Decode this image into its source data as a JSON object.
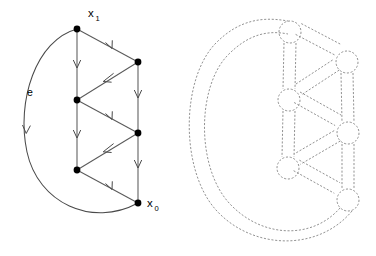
{
  "figure": {
    "background_color": "#ffffff",
    "panels": [
      {
        "id": "left-panel",
        "name": "directed-graph-panel",
        "style": "solid",
        "description": "Directed graph drawn with solid arrows, black vertex dots, base point x0 and vertex x1, and a large loop edge labelled e"
      },
      {
        "id": "right-panel",
        "name": "ribbon-graph-panel",
        "style": "dashed",
        "description": "Same graph thickened into a ribbon/handlebody, drawn entirely with grey dashed outlines; each vertex becomes a small circle and each edge a pair of parallel dashed strands"
      }
    ]
  },
  "colors": {
    "background": "#ffffff",
    "solid_stroke": "#5a5a5a",
    "loop_stroke": "#4a4a4a",
    "vertex_fill": "#000000",
    "label_text": "#000000",
    "dashed_stroke": "#8c8c8c"
  },
  "labels": {
    "x1": {
      "base": "x",
      "sub": "1",
      "x": 88,
      "y": 17
    },
    "x0": {
      "base": "x",
      "sub": "0",
      "x": 147,
      "y": 207
    },
    "e": {
      "text": "e",
      "x": 27,
      "y": 96
    }
  },
  "left_graph": {
    "vertices": [
      {
        "id": "x1",
        "name": "vertex-x1",
        "x": 77,
        "y": 29,
        "r": 3.4,
        "label": "x1"
      },
      {
        "id": "b1",
        "name": "vertex-b1",
        "x": 138,
        "y": 62,
        "r": 3.4,
        "label": ""
      },
      {
        "id": "a1",
        "name": "vertex-a1",
        "x": 77,
        "y": 100,
        "r": 3.4,
        "label": ""
      },
      {
        "id": "b2",
        "name": "vertex-b2",
        "x": 138,
        "y": 133,
        "r": 3.4,
        "label": ""
      },
      {
        "id": "a2",
        "name": "vertex-a2",
        "x": 77,
        "y": 170,
        "r": 3.4,
        "label": ""
      },
      {
        "id": "x0",
        "name": "vertex-x0",
        "x": 138,
        "y": 203,
        "r": 3.4,
        "label": "x0"
      }
    ],
    "edges": [
      {
        "id": "e1",
        "name": "edge-x1-a1",
        "from": "x1",
        "to": "a1",
        "kind": "straight",
        "arrow_t": 0.52
      },
      {
        "id": "e2",
        "name": "edge-x1-b1",
        "from": "x1",
        "to": "b1",
        "kind": "straight",
        "arrow_t": 0.55
      },
      {
        "id": "e3",
        "name": "edge-b1-a1",
        "from": "b1",
        "to": "a1",
        "kind": "straight",
        "arrow_t": 0.5
      },
      {
        "id": "e4",
        "name": "edge-b1-b2",
        "from": "b1",
        "to": "b2",
        "kind": "straight",
        "arrow_t": 0.48
      },
      {
        "id": "e5",
        "name": "edge-a1-b2",
        "from": "a1",
        "to": "b2",
        "kind": "straight",
        "arrow_t": 0.55
      },
      {
        "id": "e6",
        "name": "edge-a1-a2",
        "from": "a1",
        "to": "a2",
        "kind": "straight",
        "arrow_t": 0.52
      },
      {
        "id": "e7",
        "name": "edge-b2-a2",
        "from": "b2",
        "to": "a2",
        "kind": "straight",
        "arrow_t": 0.5
      },
      {
        "id": "e8",
        "name": "edge-b2-x0",
        "from": "b2",
        "to": "x0",
        "kind": "straight",
        "arrow_t": 0.48
      },
      {
        "id": "e9",
        "name": "edge-a2-x0",
        "from": "a2",
        "to": "x0",
        "kind": "straight",
        "arrow_t": 0.55
      },
      {
        "id": "e10",
        "name": "edge-e-loop",
        "from": "x0",
        "to": "x1",
        "kind": "loop",
        "label": "e",
        "arrow_t": 0.55
      }
    ],
    "loop_path": "M138,203 C92,228 38,203 27,152 C16,101 36,40 77,29",
    "arrow_count": 10
  },
  "right_graph": {
    "vertices": [
      {
        "id": "r-x1",
        "name": "ribbon-vertex-x1",
        "x": 290,
        "y": 32,
        "r": 11
      },
      {
        "id": "r-b1",
        "name": "ribbon-vertex-b1",
        "x": 347,
        "y": 62,
        "r": 11
      },
      {
        "id": "r-a1",
        "name": "ribbon-vertex-a1",
        "x": 289,
        "y": 100,
        "r": 11
      },
      {
        "id": "r-b2",
        "name": "ribbon-vertex-b2",
        "x": 348,
        "y": 133,
        "r": 11
      },
      {
        "id": "r-a2",
        "name": "ribbon-vertex-a2",
        "x": 288,
        "y": 168,
        "r": 11
      },
      {
        "id": "r-x0",
        "name": "ribbon-vertex-x0",
        "x": 348,
        "y": 200,
        "r": 11
      }
    ],
    "edges": [
      {
        "id": "r-e1",
        "name": "ribbon-edge-x1-a1",
        "from": "r-x1",
        "to": "r-a1",
        "half_width": 6
      },
      {
        "id": "r-e2",
        "name": "ribbon-edge-x1-b1",
        "from": "r-x1",
        "to": "r-b1",
        "half_width": 6
      },
      {
        "id": "r-e3",
        "name": "ribbon-edge-b1-a1",
        "from": "r-b1",
        "to": "r-a1",
        "half_width": 6
      },
      {
        "id": "r-e4",
        "name": "ribbon-edge-b1-b2",
        "from": "r-b1",
        "to": "r-b2",
        "half_width": 6
      },
      {
        "id": "r-e5",
        "name": "ribbon-edge-a1-b2",
        "from": "r-a1",
        "to": "r-b2",
        "half_width": 6
      },
      {
        "id": "r-e6",
        "name": "ribbon-edge-a1-a2",
        "from": "r-a1",
        "to": "r-a2",
        "half_width": 6
      },
      {
        "id": "r-e7",
        "name": "ribbon-edge-b2-a2",
        "from": "r-b2",
        "to": "r-a2",
        "half_width": 6
      },
      {
        "id": "r-e8",
        "name": "ribbon-edge-b2-x0",
        "from": "r-b2",
        "to": "r-x0",
        "half_width": 6
      },
      {
        "id": "r-e9",
        "name": "ribbon-edge-a2-x0",
        "from": "r-a2",
        "to": "r-x0",
        "half_width": 6
      }
    ],
    "loop_outer_path": "M352,211 C318,252 252,250 216,210 C180,170 181,80 215,44 C240,18 265,17 288,21",
    "loop_inner_path": "M340,208 C312,240 262,238 230,204 C196,168 197,88 227,56 C248,34 268,30 288,34"
  }
}
